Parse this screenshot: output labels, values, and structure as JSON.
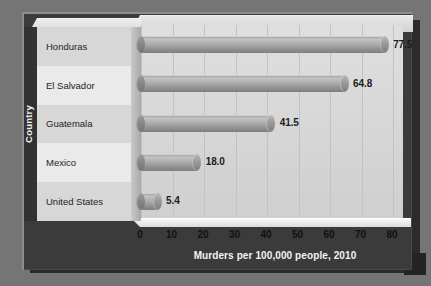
{
  "chart_data": {
    "type": "bar",
    "orientation": "horizontal",
    "title": "",
    "xlabel": "Murders per 100,000 people, 2010",
    "ylabel": "Country",
    "categories": [
      "Honduras",
      "El Salvador",
      "Guatemala",
      "Mexico",
      "United States"
    ],
    "values": [
      77.5,
      64.8,
      41.5,
      18.0,
      5.4
    ],
    "value_labels": [
      "77.5",
      "64.8",
      "41.5",
      "18.0",
      "5.4"
    ],
    "xlim": [
      0,
      80
    ],
    "xticks": [
      0,
      10,
      20,
      30,
      40,
      50,
      60,
      70,
      80
    ],
    "xtick_labels": [
      "0",
      "10",
      "20",
      "30",
      "40",
      "50",
      "60",
      "70",
      "80"
    ],
    "grid": "vertical",
    "legend": "none",
    "style_3d": true,
    "bar_style": "cylinder"
  },
  "colors": {
    "page_background": "#757575",
    "card_background": "#3b3b3b",
    "plot_background": "#dadada",
    "gridline": "#c2c2c2",
    "bar_light": "#c2c2c2",
    "bar_dark": "#7e7e7e",
    "category_row_shade": "#d7d7d7",
    "category_row_light": "#eaeaea",
    "axis_title_text": "#f3f3f3",
    "value_label_text": "#1c1c1c",
    "shadow": "#2b2b2b"
  }
}
